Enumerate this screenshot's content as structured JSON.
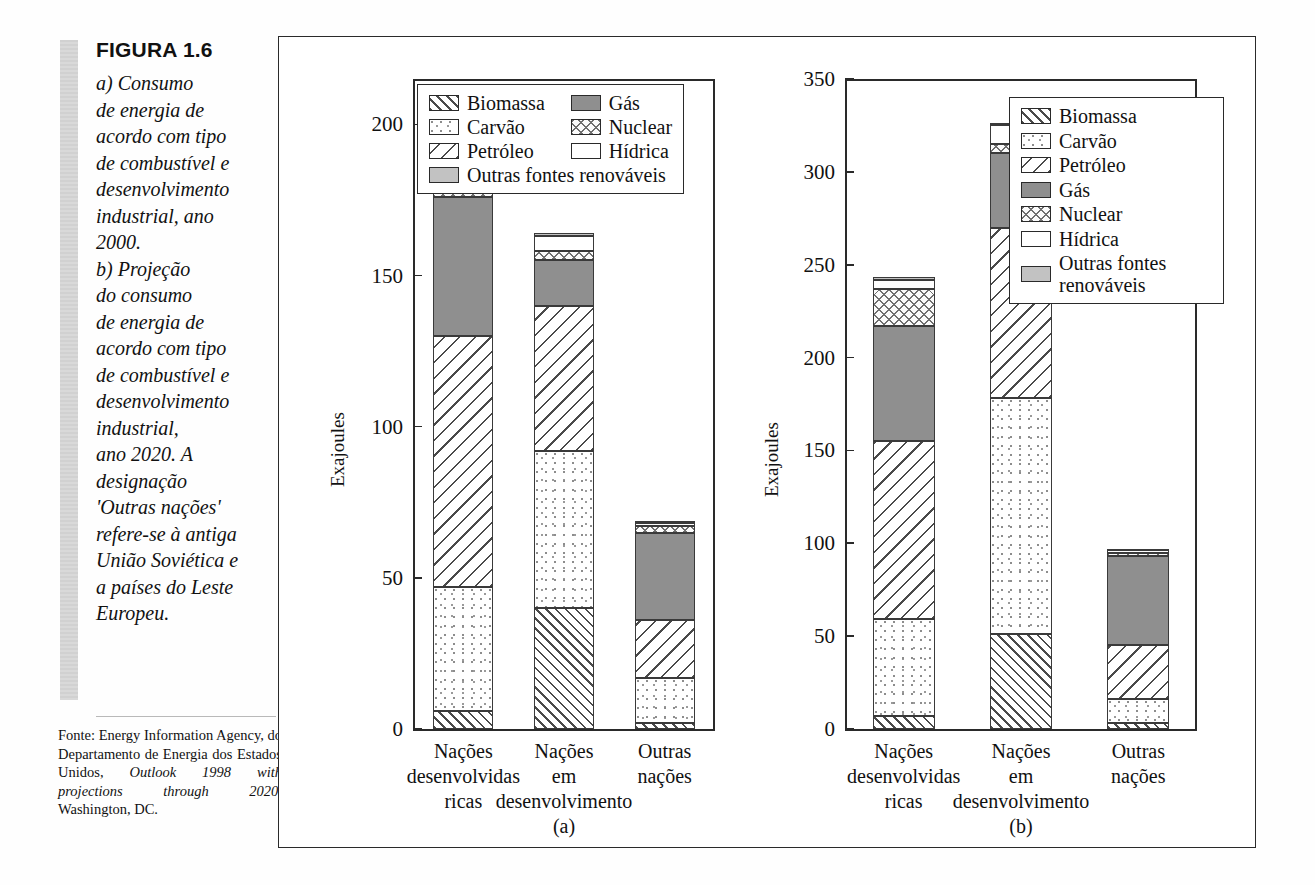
{
  "figure": {
    "number": "FIGURA 1.6",
    "caption": "a) Consumo\nde energia de\nacordo com tipo\nde combustível e\ndesenvolvimento\nindustrial, ano\n2000.\nb) Projeção\ndo consumo\nde energia de\nacordo com tipo\nde combustível e\ndesenvolvimento\nindustrial,\nano 2020. A\ndesignação\n'Outras nações'\nrefere-se à antiga\nUnião Soviética e\na países do Leste\nEuropeu.",
    "source_prefix": "Fonte: Energy Information Agency, do Departamento de Energia dos Estados Unidos, ",
    "source_italic": "Outlook 1998 with projections through 2020",
    "source_suffix": ", Washington, DC."
  },
  "legend_items": [
    {
      "label": "Biomassa",
      "pattern": "p-biomassa"
    },
    {
      "label": "Carvão",
      "pattern": "p-carvao"
    },
    {
      "label": "Petróleo",
      "pattern": "p-petroleo"
    },
    {
      "label": "Gás",
      "pattern": "p-gas"
    },
    {
      "label": "Nuclear",
      "pattern": "p-nuclear"
    },
    {
      "label": "Hídrica",
      "pattern": "p-hidrica"
    },
    {
      "label": "Outras fontes renováveis",
      "pattern": "p-outras"
    }
  ],
  "legend_a": {
    "col1": [
      "Biomassa",
      "Carvão",
      "Petróleo"
    ],
    "col2": [
      "Gás",
      "Nuclear",
      "Hídrica"
    ],
    "full": "Outras fontes renováveis"
  },
  "legend_b": {
    "items": [
      "Biomassa",
      "Carvão",
      "Petróleo",
      "Gás",
      "Nuclear",
      "Hídrica",
      "Outras fontes renováveis"
    ]
  },
  "chart_data": [
    {
      "type": "bar",
      "stacked": true,
      "panel": "(a)",
      "title": "",
      "xlabel": "",
      "ylabel": "Exajoules",
      "ylim": [
        0,
        215
      ],
      "yticks": [
        0,
        50,
        100,
        150,
        200
      ],
      "ytick_labels": [
        "0",
        "50",
        "100",
        "150",
        "200"
      ],
      "grid": false,
      "legend_position": "top-right",
      "categories": [
        "Nações\ndesenvolvidas\nricas",
        "Nações\nem\ndesenvolvimento",
        "Outras\nnações"
      ],
      "series": [
        {
          "name": "Biomassa",
          "values": [
            6,
            40,
            2
          ]
        },
        {
          "name": "Carvão",
          "values": [
            41,
            52,
            15
          ]
        },
        {
          "name": "Petróleo",
          "values": [
            83,
            48,
            19
          ]
        },
        {
          "name": "Gás",
          "values": [
            46,
            15,
            29
          ]
        },
        {
          "name": "Nuclear",
          "values": [
            21,
            3,
            2
          ]
        },
        {
          "name": "Hídrica",
          "values": [
            6,
            5,
            1
          ]
        },
        {
          "name": "Outras fontes renováveis",
          "values": [
            2,
            1,
            0.5
          ]
        }
      ],
      "totals": [
        205,
        164,
        68.5
      ]
    },
    {
      "type": "bar",
      "stacked": true,
      "panel": "(b)",
      "title": "",
      "xlabel": "",
      "ylabel": "Exajoules",
      "ylim": [
        0,
        350
      ],
      "yticks": [
        0,
        50,
        100,
        150,
        200,
        250,
        300,
        350
      ],
      "ytick_labels": [
        "0",
        "50",
        "100",
        "150",
        "200",
        "250",
        "300",
        "350"
      ],
      "grid": false,
      "legend_position": "top-right",
      "categories": [
        "Nações\ndesenvolvidas\nricas",
        "Nações\nem\ndesenvolvimento",
        "Outras\nnações"
      ],
      "series": [
        {
          "name": "Biomassa",
          "values": [
            7,
            51,
            3
          ]
        },
        {
          "name": "Carvão",
          "values": [
            52,
            127,
            13
          ]
        },
        {
          "name": "Petróleo",
          "values": [
            96,
            92,
            29
          ]
        },
        {
          "name": "Gás",
          "values": [
            62,
            40,
            48
          ]
        },
        {
          "name": "Nuclear",
          "values": [
            20,
            5,
            2
          ]
        },
        {
          "name": "Hídrica",
          "values": [
            5,
            10,
            1
          ]
        },
        {
          "name": "Outras fontes renováveis",
          "values": [
            1,
            1,
            0.5
          ]
        }
      ],
      "totals": [
        243,
        326,
        96.5
      ]
    }
  ]
}
